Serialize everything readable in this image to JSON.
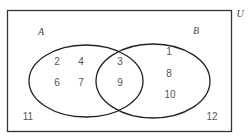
{
  "diagram": {
    "type": "venn",
    "universe_label": "U",
    "sets": [
      {
        "name": "A",
        "only": [
          "2",
          "4",
          "6",
          "7"
        ]
      },
      {
        "name": "B",
        "only": [
          "1",
          "8",
          "10"
        ]
      }
    ],
    "intersection": [
      "3",
      "9"
    ],
    "outside": [
      "11",
      "12"
    ]
  },
  "labels": {
    "U": "U",
    "A": "A",
    "B": "B",
    "a1": "2",
    "a2": "4",
    "a3": "6",
    "a4": "7",
    "ab1": "3",
    "ab2": "9",
    "b1": "1",
    "b2": "8",
    "b3": "10",
    "o1": "11",
    "o2": "12"
  }
}
